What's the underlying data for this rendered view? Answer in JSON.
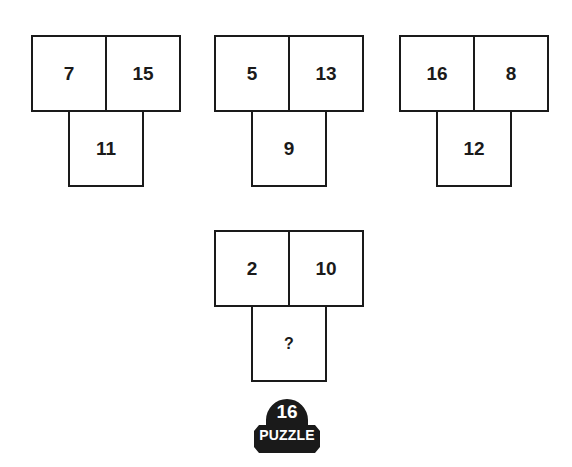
{
  "puzzle": {
    "groups": [
      {
        "top_left": "7",
        "top_right": "15",
        "bottom": "11"
      },
      {
        "top_left": "5",
        "top_right": "13",
        "bottom": "9"
      },
      {
        "top_left": "16",
        "top_right": "8",
        "bottom": "12"
      },
      {
        "top_left": "2",
        "top_right": "10",
        "bottom": "?"
      }
    ]
  },
  "badge": {
    "number": "16",
    "label": "PUZZLE",
    "color": "#1a1a1a"
  }
}
